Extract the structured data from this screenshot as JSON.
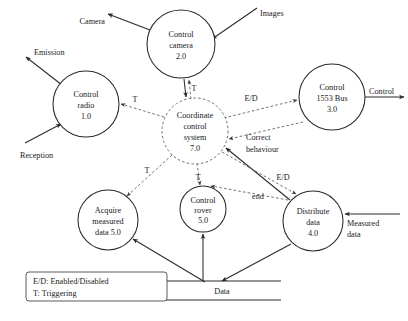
{
  "diagram": {
    "type": "data-flow-diagram",
    "processes": [
      {
        "id": "control-radio",
        "lines": [
          "Control",
          "radio",
          "1.0"
        ],
        "cx": 86,
        "cy": 104,
        "r": 33,
        "control": false
      },
      {
        "id": "control-camera",
        "lines": [
          "Control",
          "camera",
          "2.0"
        ],
        "cx": 181,
        "cy": 44,
        "r": 34,
        "control": false
      },
      {
        "id": "control-1553",
        "lines": [
          "Control",
          "1553 Bus",
          "3.0"
        ],
        "cx": 332,
        "cy": 97,
        "r": 33,
        "control": false
      },
      {
        "id": "distribute-data",
        "lines": [
          "Distribute",
          "data",
          "4.0"
        ],
        "cx": 313,
        "cy": 221,
        "r": 30,
        "control": false
      },
      {
        "id": "control-rover",
        "lines": [
          "Control",
          "rover",
          "5.0"
        ],
        "cx": 203,
        "cy": 209,
        "r": 23,
        "control": false
      },
      {
        "id": "acquire-data",
        "lines": [
          "Acquire",
          "measured",
          "data 5.0"
        ],
        "cx": 108,
        "cy": 220,
        "r": 30,
        "control": false
      },
      {
        "id": "coordinate",
        "lines": [
          "Coordinate",
          "control",
          "system",
          "7.0"
        ],
        "cx": 195,
        "cy": 131,
        "r": 33,
        "control": true
      }
    ],
    "data_store": {
      "label": "Data"
    },
    "external_flows": [
      {
        "name": "emission",
        "label": "Emission"
      },
      {
        "name": "reception",
        "label": "Reception"
      },
      {
        "name": "camera",
        "label": "Camera"
      },
      {
        "name": "images",
        "label": "Images"
      },
      {
        "name": "control-out",
        "label": "Control"
      },
      {
        "name": "measured-data",
        "label": "Measured\ndata"
      }
    ],
    "control_flow_labels": [
      {
        "name": "t-radio",
        "label": "T"
      },
      {
        "name": "t-camera",
        "label": "T"
      },
      {
        "name": "t-acquire",
        "label": "T"
      },
      {
        "name": "t-rover",
        "label": "T"
      },
      {
        "name": "ed-1553",
        "label": "E/D"
      },
      {
        "name": "ed-distribute",
        "label": "E/D"
      },
      {
        "name": "correct-1",
        "label": "Correct"
      },
      {
        "name": "correct-2",
        "label": "behaviour"
      },
      {
        "name": "end",
        "label": "end"
      }
    ],
    "legend": {
      "line1": "E/D: Enabled/Disabled",
      "line2": "T: Triggering"
    }
  },
  "labels": {
    "emission": "Emission",
    "reception": "Reception",
    "camera": "Camera",
    "images": "Images",
    "control_out": "Control",
    "measured_1": "Measured",
    "measured_2": "data",
    "store": "Data",
    "t1": "T",
    "t2": "T",
    "t3": "T",
    "t4": "T",
    "ed1": "E/D",
    "ed2": "E/D",
    "correct1": "Correct",
    "correct2": "behaviour",
    "end": "end",
    "legend1": "E/D: Enabled/Disabled",
    "legend2": "T: Triggering"
  },
  "processes": {
    "radio": {
      "l1": "Control",
      "l2": "radio",
      "l3": "1.0"
    },
    "camera": {
      "l1": "Control",
      "l2": "camera",
      "l3": "2.0"
    },
    "bus": {
      "l1": "Control",
      "l2": "1553 Bus",
      "l3": "3.0"
    },
    "distribute": {
      "l1": "Distribute",
      "l2": "data",
      "l3": "4.0"
    },
    "rover": {
      "l1": "Control",
      "l2": "rover",
      "l3": "5.0"
    },
    "acquire": {
      "l1": "Acquire",
      "l2": "measured",
      "l3": "data 5.0"
    },
    "coordinate": {
      "l1": "Coordinate",
      "l2": "control",
      "l3": "system",
      "l4": "7.0"
    }
  },
  "colors": {
    "solid_stroke": "#2a2a2a",
    "dashed_stroke": "#6a6a6a",
    "text": "#1a1a1a",
    "background": "#ffffff"
  }
}
